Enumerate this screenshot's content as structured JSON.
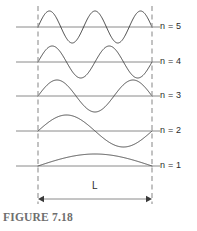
{
  "figure": {
    "caption": "FIGURE 7.18",
    "length_label": "L",
    "colors": {
      "wave": "#4a4a4a",
      "axis": "#8a8a8a",
      "dashed_boundary": "#9a9a9a",
      "text": "#2b2b2b",
      "caption": "#6e6e6e",
      "background": "#ffffff"
    },
    "modes": [
      {
        "label": "n = 5",
        "n": 5,
        "half_wavelengths": 5,
        "baseline_y": 27,
        "amplitude": 16
      },
      {
        "label": "n = 4",
        "n": 4,
        "half_wavelengths": 4,
        "baseline_y": 62,
        "amplitude": 16
      },
      {
        "label": "n = 3",
        "n": 3,
        "half_wavelengths": 3,
        "baseline_y": 96,
        "amplitude": 16
      },
      {
        "label": "n = 2",
        "n": 2,
        "half_wavelengths": 2,
        "baseline_y": 131,
        "amplitude": 16
      },
      {
        "label": "n = 1",
        "n": 1,
        "half_wavelengths": 1,
        "baseline_y": 166,
        "amplitude": 12
      }
    ],
    "boundaries": {
      "left_x": 38,
      "right_x": 152,
      "top_y": 6,
      "bottom_y": 204
    },
    "dimension_arrow": {
      "y": 199,
      "label_y": 180
    }
  },
  "chart_data": {
    "type": "line",
    "title": "FIGURE 7.18",
    "xlabel": "L",
    "ylabel": "",
    "x": [
      0,
      1
    ],
    "series": [
      {
        "name": "n = 5",
        "values": [
          0,
          0
        ],
        "half_wavelengths": 5,
        "amplitude": 16
      },
      {
        "name": "n = 4",
        "values": [
          0,
          0
        ],
        "half_wavelengths": 4,
        "amplitude": 16
      },
      {
        "name": "n = 3",
        "values": [
          0,
          0
        ],
        "half_wavelengths": 3,
        "amplitude": 16
      },
      {
        "name": "n = 2",
        "values": [
          0,
          0
        ],
        "half_wavelengths": 2,
        "amplitude": 16
      },
      {
        "name": "n = 1",
        "values": [
          0,
          0
        ],
        "half_wavelengths": 1,
        "amplitude": 12
      }
    ],
    "annotations": [
      "n = 5",
      "n = 4",
      "n = 3",
      "n = 2",
      "n = 1",
      "L"
    ],
    "grid": false,
    "legend": "right"
  }
}
